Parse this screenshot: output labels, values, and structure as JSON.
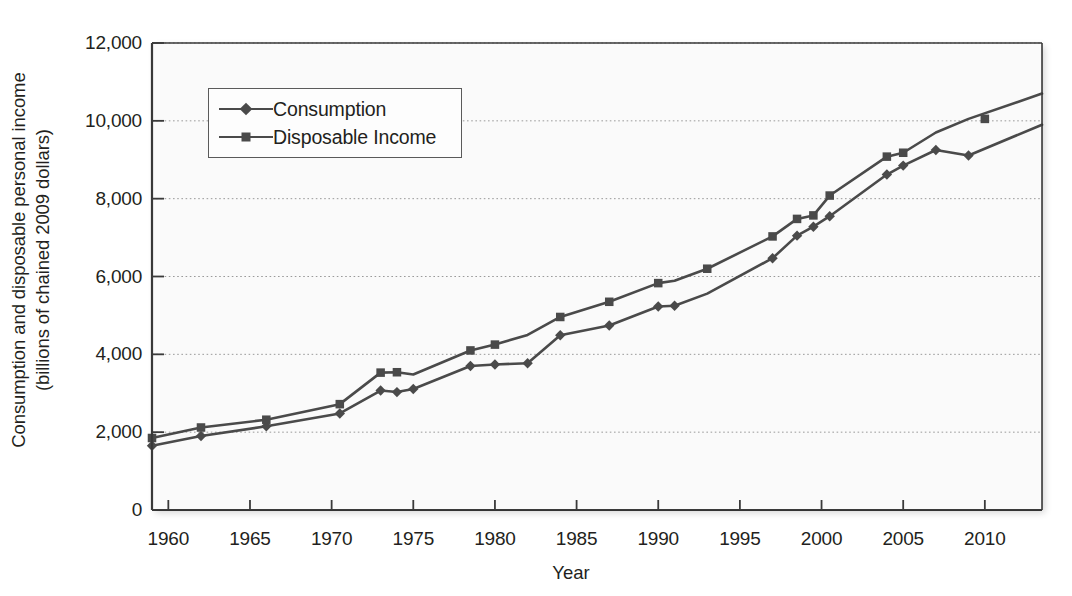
{
  "chart_data": {
    "type": "line",
    "title": "",
    "xlabel": "Year",
    "ylabel_line1": "Consumption and disposable personal income",
    "ylabel_line2": "(billions of chained 2009 dollars)",
    "xlim": [
      1959,
      2013.5
    ],
    "ylim": [
      0,
      12000
    ],
    "xticks": [
      1960,
      1965,
      1970,
      1975,
      1980,
      1985,
      1990,
      1995,
      2000,
      2005,
      2010
    ],
    "xticklabels": [
      "1960",
      "1965",
      "1970",
      "1975",
      "1980",
      "1985",
      "1990",
      "1995",
      "2000",
      "2005",
      "2010"
    ],
    "yticks": [
      0,
      2000,
      4000,
      6000,
      8000,
      10000,
      12000
    ],
    "yticklabels": [
      "0",
      "2,000",
      "4,000",
      "6,000",
      "8,000",
      "10,000",
      "12,000"
    ],
    "grid": "horizontal-dotted",
    "legend_position": "upper-left-inside",
    "plot_bgcolor": "#fafafa",
    "line_color": "#4a4a4a",
    "series": [
      {
        "name": "Consumption",
        "marker": "diamond",
        "color": "#4a4a4a",
        "x": [
          1959,
          1962,
          1966,
          1970.5,
          1973,
          1974,
          1975,
          1978.5,
          1980,
          1982,
          1984,
          1987,
          1990,
          1991,
          1993,
          1997,
          1998.5,
          1999.5,
          2000.5,
          2004,
          2005,
          2007,
          2009,
          2013.5
        ],
        "y": [
          1650,
          1900,
          2150,
          2480,
          3070,
          3030,
          3110,
          3700,
          3740,
          3770,
          4490,
          4740,
          5230,
          5250,
          5560,
          6470,
          7050,
          7280,
          7550,
          8620,
          8850,
          9250,
          9110,
          9900
        ],
        "markers_x": [
          1959,
          1962,
          1966,
          1970.5,
          1973,
          1974,
          1975,
          1978.5,
          1980,
          1982,
          1984,
          1987,
          1990,
          1991,
          1997,
          1998.5,
          1999.5,
          2000.5,
          2004,
          2005,
          2007,
          2009
        ],
        "markers_y": [
          1650,
          1900,
          2150,
          2480,
          3070,
          3030,
          3110,
          3700,
          3740,
          3770,
          4490,
          4740,
          5230,
          5250,
          6470,
          7050,
          7280,
          7550,
          8620,
          8850,
          9250,
          9110
        ]
      },
      {
        "name": "Disposable Income",
        "marker": "square",
        "color": "#4a4a4a",
        "x": [
          1959,
          1962,
          1966,
          1970.5,
          1973,
          1974,
          1975,
          1978.5,
          1980,
          1982,
          1984,
          1987,
          1990,
          1991,
          1993,
          1997,
          1998.5,
          1999.5,
          2000.5,
          2004,
          2005,
          2007,
          2009,
          2013.5
        ],
        "y": [
          1850,
          2120,
          2320,
          2720,
          3530,
          3540,
          3480,
          4100,
          4250,
          4500,
          4960,
          5350,
          5830,
          5890,
          6200,
          7030,
          7480,
          7570,
          8080,
          9080,
          9180,
          9700,
          10050,
          10700
        ],
        "markers_x": [
          1959,
          1962,
          1966,
          1970.5,
          1973,
          1974,
          1978.5,
          1980,
          1984,
          1987,
          1990,
          1993,
          1997,
          1998.5,
          1999.5,
          2000.5,
          2004,
          2005,
          2010
        ],
        "markers_y": [
          1850,
          2120,
          2320,
          2720,
          3530,
          3540,
          4100,
          4250,
          4960,
          5350,
          5830,
          6200,
          7030,
          7480,
          7570,
          8080,
          9080,
          9180,
          10050
        ]
      }
    ]
  },
  "legend": {
    "entries": [
      {
        "label": "Consumption",
        "marker": "diamond"
      },
      {
        "label": "Disposable Income",
        "marker": "square"
      }
    ]
  }
}
